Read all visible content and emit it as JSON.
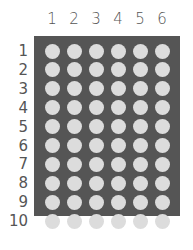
{
  "columns": [
    "1",
    "2",
    "3",
    "4",
    "5",
    "6"
  ],
  "rows": [
    "1",
    "2",
    "3",
    "4",
    "5",
    "6",
    "7",
    "8",
    "9",
    "10"
  ],
  "colors": {
    "panel": "#555555",
    "dot": "#dcdcdc",
    "label": "#555555"
  }
}
